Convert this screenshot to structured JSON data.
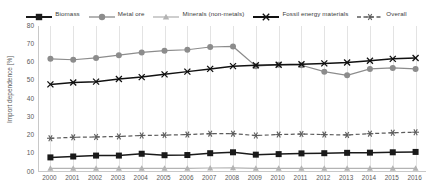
{
  "chart_data": {
    "type": "line",
    "title": "",
    "xlabel": "",
    "ylabel": "Import dependence [%]",
    "ylim": [
      0,
      80
    ],
    "ytick_labels": [
      "00",
      "10",
      "20",
      "30",
      "40",
      "50",
      "60",
      "70",
      "80"
    ],
    "ytick_values": [
      0,
      10,
      20,
      30,
      40,
      50,
      60,
      70,
      80
    ],
    "grid": "vertical",
    "legend_position": "top",
    "categories": [
      "2000",
      "2001",
      "2002",
      "2003",
      "2004",
      "2005",
      "2006",
      "2007",
      "2008",
      "2009",
      "2010",
      "2011",
      "2012",
      "2013",
      "2014",
      "2015",
      "2016"
    ],
    "series": [
      {
        "name": "Biomass",
        "color": "#1a1a1a",
        "marker": "square",
        "dash": "solid",
        "values": [
          8,
          8.5,
          9,
          9,
          10,
          9.2,
          9.3,
          10.3,
          10.8,
          9.5,
          9.8,
          10.2,
          10.3,
          10.5,
          10.6,
          10.8,
          11
        ]
      },
      {
        "name": "Metal ore",
        "color": "#8c8c8c",
        "marker": "circle",
        "dash": "solid",
        "values": [
          62,
          61.5,
          62.5,
          64,
          65.5,
          66.5,
          67,
          68.5,
          68.8,
          58,
          58.8,
          58.5,
          55,
          53,
          56.5,
          57,
          56.5
        ]
      },
      {
        "name": "Minerals (non-metals)",
        "color": "#b3b3b3",
        "marker": "triangle",
        "dash": "solid",
        "values": [
          2,
          2,
          2,
          2,
          2,
          2,
          2,
          2.2,
          2.3,
          2,
          2,
          2,
          2,
          2,
          2,
          2,
          2
        ]
      },
      {
        "name": "Fossil energy materials",
        "color": "#111111",
        "marker": "cross",
        "dash": "solid",
        "values": [
          48,
          49,
          49.5,
          51,
          52,
          53.5,
          55,
          56.5,
          58,
          58.5,
          58.8,
          59,
          59.5,
          60,
          61,
          62,
          62.5
        ]
      },
      {
        "name": "Overall",
        "color": "#5c5c5c",
        "marker": "asterisk",
        "dash": "dashed",
        "values": [
          18.5,
          19,
          19.2,
          19.5,
          20,
          20.2,
          20.5,
          21,
          21,
          20,
          20.5,
          20.8,
          20.5,
          20.3,
          21,
          21.5,
          21.8
        ]
      }
    ]
  }
}
